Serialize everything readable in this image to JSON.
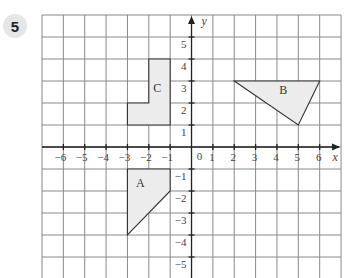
{
  "question_number": "5",
  "diagram": {
    "x_axis_label": "x",
    "y_axis_label": "y",
    "origin_label": "0",
    "x_range": [
      -7,
      7
    ],
    "y_range": [
      -5.5,
      6
    ],
    "x_tick_labels": [
      "-6",
      "-5",
      "-4",
      "-3",
      "-2",
      "-1",
      "1",
      "2",
      "3",
      "4",
      "5",
      "6"
    ],
    "x_tick_values": [
      -6,
      -5,
      -4,
      -3,
      -2,
      -1,
      1,
      2,
      3,
      4,
      5,
      6
    ],
    "y_tick_labels": [
      "5",
      "4",
      "3",
      "2",
      "1",
      "-1",
      "-2",
      "-3",
      "-4",
      "-5"
    ],
    "y_tick_values": [
      5,
      4,
      3,
      2,
      1,
      -1,
      -2,
      -3,
      -4,
      -5
    ],
    "shapes": [
      {
        "name": "A",
        "label": "A",
        "vertices": [
          [
            -3,
            -1
          ],
          [
            -1,
            -1
          ],
          [
            -1,
            -2
          ],
          [
            -3,
            -4
          ]
        ],
        "label_at": [
          -2.4,
          -1.8
        ]
      },
      {
        "name": "B",
        "label": "B",
        "vertices": [
          [
            2,
            3
          ],
          [
            6,
            3
          ],
          [
            5,
            1
          ]
        ],
        "label_at": [
          4.3,
          2.4
        ]
      },
      {
        "name": "C",
        "label": "C",
        "vertices": [
          [
            -3,
            1
          ],
          [
            -1,
            1
          ],
          [
            -1,
            4
          ],
          [
            -2,
            4
          ],
          [
            -2,
            2
          ],
          [
            -3,
            2
          ]
        ],
        "label_at": [
          -1.6,
          2.5
        ]
      }
    ],
    "colors": {
      "shape_fill": "#ececec",
      "grid": "#8a8a8a",
      "axis": "#222222"
    }
  }
}
